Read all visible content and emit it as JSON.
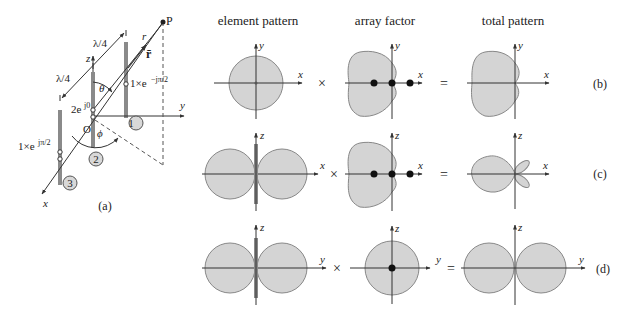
{
  "figure": {
    "panel_a": {
      "caption": "(a)",
      "point": "P",
      "r_label": "r",
      "r_vector": "r̄",
      "axes": {
        "x": "x",
        "y": "y",
        "z": "z"
      },
      "origin": "O",
      "theta": "θ",
      "phi": "ϕ",
      "spacing_top": "λ/4",
      "spacing_left": "λ/4",
      "element_1": {
        "number": "1",
        "excitation": "1×e",
        "exponent": "−jπ/2"
      },
      "element_2": {
        "number": "2",
        "excitation": "2e",
        "exponent": "j0"
      },
      "element_3": {
        "number": "3",
        "excitation": "1×e",
        "exponent": "jπ/2"
      }
    },
    "column_headers": {
      "element": "element pattern",
      "array": "array factor",
      "total": "total pattern"
    },
    "operators": {
      "times": "×",
      "equals": "="
    },
    "rows": [
      {
        "id": "b",
        "label": "(b)",
        "vertical_axis": "y",
        "horizontal_axis": "x",
        "total_h_axis": "x"
      },
      {
        "id": "c",
        "label": "(c)",
        "vertical_axis": "z",
        "horizontal_axis": "x",
        "total_h_axis": "x"
      },
      {
        "id": "d",
        "label": "(d)",
        "vertical_axis": "z",
        "horizontal_axis": "y",
        "total_h_axis": "y"
      }
    ],
    "colors": {
      "lobe_fill": "#d4d4d4",
      "lobe_stroke": "#888888",
      "dipole": "#8a8a8a"
    }
  }
}
